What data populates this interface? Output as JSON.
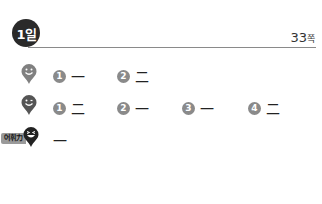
{
  "header": {
    "day_badge": "1일",
    "page_number": "33",
    "page_unit": "쪽"
  },
  "rows": [
    {
      "icon": "smile-pin-icon",
      "items": [
        {
          "number": "1",
          "answer": "一"
        },
        {
          "number": "2",
          "answer": "二"
        }
      ]
    },
    {
      "icon": "wink-pin-icon",
      "items": [
        {
          "number": "1",
          "answer": "二"
        },
        {
          "number": "2",
          "answer": "一"
        },
        {
          "number": "3",
          "answer": "一"
        },
        {
          "number": "4",
          "answer": "二"
        }
      ]
    },
    {
      "icon": "laugh-pin-icon",
      "tag": "어휘力",
      "items": [
        {
          "answer": "一"
        }
      ]
    }
  ],
  "colors": {
    "badge": "#2a2a2a",
    "number_circle": "#8a8a8a",
    "pin_light": "#808080",
    "pin_dark": "#555555"
  }
}
